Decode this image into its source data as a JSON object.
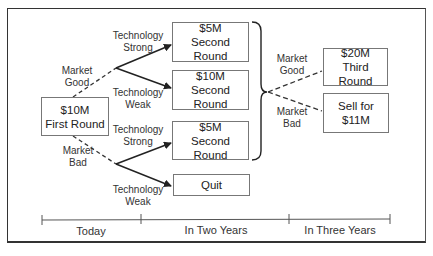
{
  "diagram": {
    "type": "decision-tree",
    "root": {
      "line1": "$10M",
      "line2": "First Round"
    },
    "second_round_boxes": [
      {
        "line1": "$5M",
        "line2": "Second Round"
      },
      {
        "line1": "$10M",
        "line2": "Second Round"
      },
      {
        "line1": "$5M",
        "line2": "Second Round"
      },
      {
        "line1": "Quit"
      }
    ],
    "third_round_boxes": [
      {
        "line1": "$20M",
        "line2": "Third Round"
      },
      {
        "line1": "Sell for",
        "line2": "$11M"
      }
    ],
    "branch_labels": {
      "market_good": {
        "line1": "Market",
        "line2": "Good"
      },
      "market_bad": {
        "line1": "Market",
        "line2": "Bad"
      },
      "tech_strong_upper": {
        "line1": "Technology",
        "line2": "Strong"
      },
      "tech_weak_upper": {
        "line1": "Technology",
        "line2": "Weak"
      },
      "tech_strong_lower": {
        "line1": "Technology",
        "line2": "Strong"
      },
      "tech_weak_lower": {
        "line1": "Technology",
        "line2": "Weak"
      },
      "market_good_right": {
        "line1": "Market",
        "line2": "Good"
      },
      "market_bad_right": {
        "line1": "Market",
        "line2": "Bad"
      }
    },
    "timeline": [
      "Today",
      "In Two Years",
      "In Three Years"
    ],
    "colors": {
      "line": "#222222",
      "box_border": "#777777"
    }
  }
}
